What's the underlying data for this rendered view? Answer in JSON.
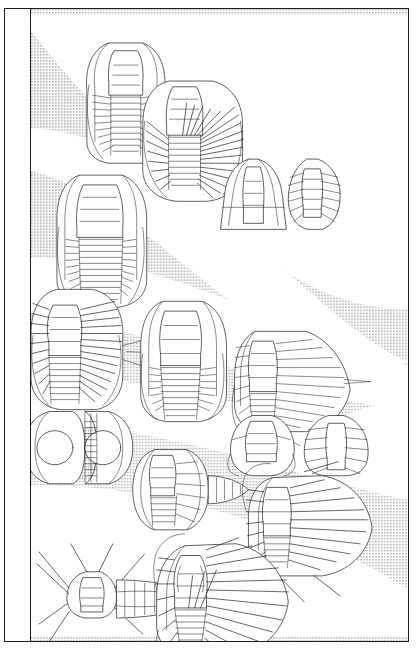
{
  "figure": {
    "kind": "trilobite-order-phylogeny-plate",
    "background_color": "#ffffff",
    "frame_color": "#1a1a1a",
    "halftone_gray": "#d6d6d6",
    "branch_color": "#ffffff",
    "line_art_color": "#2b2b2b"
  },
  "label_column": {
    "orientation": "rotated-90-ccw",
    "orders": [
      {
        "id": "corynexochida",
        "label": "CORYNEXOCHIDA",
        "band_index": 5,
        "center_y_pct": 12
      },
      {
        "id": "ptychopariida",
        "label": "PTYCHOPARIIDA",
        "band_index": 4,
        "center_y_pct": 31
      },
      {
        "id": "redlichiida",
        "label": "REDLICHIIDA",
        "band_index": 3,
        "center_y_pct": 50
      },
      {
        "id": "agnostida",
        "label": "AGNOSTIDA",
        "band_index": 2,
        "center_y_pct": 68
      },
      {
        "id": "olenellida",
        "label": "OLENELLIDA",
        "band_index": 1,
        "center_y_pct": 88
      }
    ]
  },
  "plate": {
    "branch_count": 5,
    "branch_description": "white tapering wedges radiating from a common stem at the right toward the left, separated by gray halftone",
    "specimen_count": 13,
    "specimens": [
      {
        "id": "spec-corynexochid-1",
        "order": "corynexochida",
        "form": "complete-dorsal-exoskeleton"
      },
      {
        "id": "spec-corynexochid-2",
        "order": "corynexochida",
        "form": "spiny-complete-exoskeleton"
      },
      {
        "id": "spec-ptychopariid-1",
        "order": "ptychopariida",
        "form": "complete-dorsal-exoskeleton"
      },
      {
        "id": "spec-ptychopariid-cephalon",
        "order": "ptychopariida",
        "form": "isolated-cephalon"
      },
      {
        "id": "spec-ptychopariid-pygidium",
        "order": "ptychopariida",
        "form": "isolated-pygidium"
      },
      {
        "id": "spec-redlichiid-1",
        "order": "redlichiida",
        "form": "spiny-complete-exoskeleton"
      },
      {
        "id": "spec-redlichiid-2",
        "order": "redlichiida",
        "form": "complete-dorsal-exoskeleton"
      },
      {
        "id": "spec-redlichiid-3",
        "order": "redlichiida",
        "form": "elongate-complete-exoskeleton"
      },
      {
        "id": "spec-agnostid-1",
        "order": "agnostida",
        "form": "two-segment-isopygous"
      },
      {
        "id": "spec-agnostid-2",
        "order": "agnostida",
        "form": "eodiscid-complete-exoskeleton"
      },
      {
        "id": "spec-agnostid-cephalon",
        "order": "agnostida",
        "form": "isolated-cephalon"
      },
      {
        "id": "spec-agnostid-pygidium",
        "order": "agnostida",
        "form": "isolated-pygidium"
      },
      {
        "id": "spec-olenellid-1",
        "order": "olenellida",
        "form": "long-spined-exoskeleton"
      },
      {
        "id": "spec-olenellid-2",
        "order": "olenellida",
        "form": "spiny-complete-exoskeleton"
      },
      {
        "id": "spec-upper-agnostida-right",
        "order": "agnostida",
        "form": "spiny-complete-exoskeleton"
      }
    ]
  }
}
